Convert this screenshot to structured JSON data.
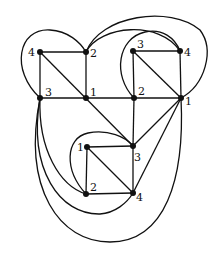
{
  "diagram": {
    "colors": {
      "stroke": "#111111",
      "background": "#ffffff"
    },
    "nodes": [
      {
        "id": "tl4",
        "label": "4"
      },
      {
        "id": "tl2",
        "label": "2"
      },
      {
        "id": "tl3",
        "label": "3"
      },
      {
        "id": "tl1",
        "label": "1"
      },
      {
        "id": "tr3",
        "label": "3"
      },
      {
        "id": "tr4",
        "label": "4"
      },
      {
        "id": "tr2",
        "label": "2"
      },
      {
        "id": "tr1",
        "label": "1"
      },
      {
        "id": "b1",
        "label": "1"
      },
      {
        "id": "b3",
        "label": "3"
      },
      {
        "id": "b2",
        "label": "2"
      },
      {
        "id": "b4",
        "label": "4"
      }
    ],
    "edges": [
      [
        "tl4",
        "tl2"
      ],
      [
        "tl4",
        "tl3"
      ],
      [
        "tl4",
        "tl1"
      ],
      [
        "tl2",
        "tl1"
      ],
      [
        "tl3",
        "tl1"
      ],
      [
        "tl1",
        "tr2"
      ],
      [
        "tr2",
        "tr1"
      ],
      [
        "tr3",
        "tr4"
      ],
      [
        "tr3",
        "tr2"
      ],
      [
        "tr3",
        "tr1"
      ],
      [
        "tr4",
        "tr1"
      ],
      [
        "tl1",
        "b3"
      ],
      [
        "tr2",
        "b3"
      ],
      [
        "tr1",
        "b3"
      ],
      [
        "tr1",
        "b4"
      ],
      [
        "b1",
        "b3"
      ],
      [
        "b1",
        "b2"
      ],
      [
        "b1",
        "b4"
      ],
      [
        "b2",
        "b4"
      ],
      [
        "b3",
        "b4"
      ],
      [
        "tl3",
        "tl2"
      ],
      [
        "tl2",
        "tr4"
      ],
      [
        "tl2",
        "tr1"
      ],
      [
        "tr2",
        "tr4"
      ],
      [
        "b2",
        "b3"
      ],
      [
        "tl3",
        "b2"
      ],
      [
        "tl3",
        "b4"
      ],
      [
        "tl3",
        "tr1"
      ]
    ]
  }
}
